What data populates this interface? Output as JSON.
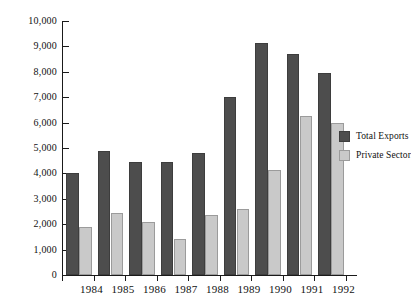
{
  "chart_data": {
    "type": "bar",
    "title": "",
    "subtitle": "",
    "xlabel": "",
    "ylabel": "",
    "categories": [
      "1984",
      "1985",
      "1986",
      "1987",
      "1988",
      "1989",
      "1990",
      "1991",
      "1992"
    ],
    "series": [
      {
        "name": "Total Exports",
        "color": "#4d4d4d",
        "values": [
          4000,
          4900,
          4450,
          4450,
          4800,
          7000,
          9150,
          8700,
          7950
        ]
      },
      {
        "name": "Private Sector",
        "color": "#c9c9c9",
        "values": [
          1900,
          2450,
          2100,
          1400,
          2350,
          2600,
          4150,
          6250,
          6000
        ]
      }
    ],
    "ylim": [
      0,
      10000
    ],
    "ytick_values": [
      0,
      1000,
      2000,
      3000,
      4000,
      5000,
      6000,
      7000,
      8000,
      9000,
      10000
    ],
    "ytick_labels": [
      "0",
      "1,000",
      "2,000",
      "3,000",
      "4,000",
      "5,000",
      "6,000",
      "7,000",
      "8,000",
      "9,000",
      "10,000"
    ],
    "grid": false,
    "legend_position": "right"
  },
  "legend": {
    "items": [
      {
        "label": "Total Exports",
        "swatch": "total"
      },
      {
        "label": "Private Sector",
        "swatch": "private"
      }
    ]
  }
}
